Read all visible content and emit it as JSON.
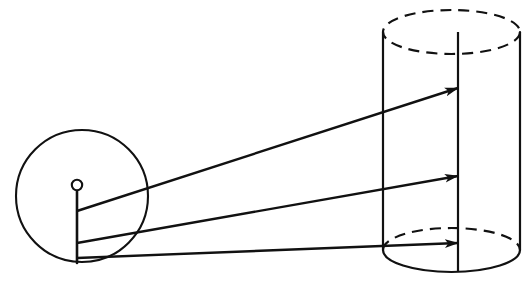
{
  "canvas": {
    "width": 528,
    "height": 285,
    "background": "#ffffff",
    "stroke_color": "#111111"
  },
  "diagram": {
    "type": "geometric-optics-diagram",
    "stroke_color": "#111111"
  },
  "source": {
    "name": "circle",
    "shape": "circle",
    "cx": 82,
    "cy": 196,
    "r": 66,
    "stroke_width": 2.1,
    "fill": "none"
  },
  "hub": {
    "name": "center-point",
    "shape": "circle",
    "cx": 77,
    "cy": 185,
    "r": 5.2,
    "stroke_width": 2.1,
    "fill": "none"
  },
  "spoke": {
    "name": "radius-line",
    "x1": 77,
    "y1": 190,
    "x2": 77,
    "y2": 263,
    "stroke_width": 2.6
  },
  "cylinder": {
    "name": "cylinder",
    "left_x": 383,
    "right_x": 520,
    "center_x": 451.5,
    "rx": 68.5,
    "top_cy": 32,
    "bottom_cy": 250,
    "ry": 22,
    "stroke_width": 2.2,
    "axis_x": 458,
    "axis_top_y": 32,
    "axis_bottom_y": 272,
    "top_ellipse_style": "dashed",
    "bottom_back_style": "dashed",
    "bottom_front_style": "solid",
    "dash_pattern": "11 7"
  },
  "rays": [
    {
      "name": "ray-upper",
      "x1": 77,
      "y1": 211,
      "x2": 458,
      "y2": 88,
      "stroke_width": 2.4,
      "arrowhead": true
    },
    {
      "name": "ray-middle",
      "x1": 77,
      "y1": 243,
      "x2": 458,
      "y2": 176,
      "stroke_width": 2.4,
      "arrowhead": true
    },
    {
      "name": "ray-lower",
      "x1": 77,
      "y1": 258,
      "x2": 458,
      "y2": 243,
      "stroke_width": 2.4,
      "arrowhead": true
    }
  ],
  "arrowhead": {
    "name": "arrowhead-marker",
    "length": 15,
    "half_width": 5
  }
}
